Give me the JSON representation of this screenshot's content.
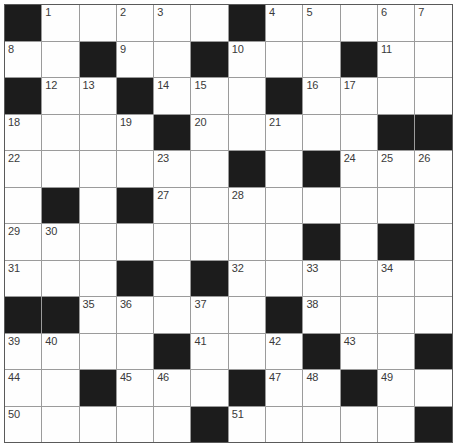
{
  "puzzle": {
    "kind": "crossword-grid",
    "rows": 12,
    "cols": 12,
    "black_marker": "B",
    "grid": [
      [
        "B",
        "1",
        "",
        "2",
        "3",
        "",
        "B",
        "4",
        "5",
        "",
        "6",
        "7"
      ],
      [
        "8",
        "",
        "B",
        "9",
        "",
        "B",
        "10",
        "",
        "",
        "B",
        "11",
        ""
      ],
      [
        "B",
        "12",
        "13",
        "B",
        "14",
        "15",
        "",
        "B",
        "16",
        "17",
        "",
        ""
      ],
      [
        "18",
        "",
        "",
        "19",
        "B",
        "20",
        "",
        "21",
        "",
        "",
        "B",
        "B"
      ],
      [
        "22",
        "",
        "",
        "",
        "23",
        "",
        "B",
        "",
        "B",
        "24",
        "25",
        "26"
      ],
      [
        "",
        "B",
        "",
        "B",
        "27",
        "",
        "28",
        "",
        "",
        "",
        "",
        ""
      ],
      [
        "29",
        "30",
        "",
        "",
        "",
        "",
        "",
        "",
        "B",
        "",
        "B",
        ""
      ],
      [
        "31",
        "",
        "",
        "B",
        "",
        "B",
        "32",
        "",
        "33",
        "",
        "34",
        ""
      ],
      [
        "B",
        "B",
        "35",
        "36",
        "",
        "37",
        "",
        "B",
        "38",
        "",
        "",
        ""
      ],
      [
        "39",
        "40",
        "",
        "",
        "B",
        "41",
        "",
        "42",
        "B",
        "43",
        "",
        "B"
      ],
      [
        "44",
        "",
        "B",
        "45",
        "46",
        "",
        "B",
        "47",
        "48",
        "B",
        "49",
        ""
      ],
      [
        "50",
        "",
        "",
        "",
        "",
        "B",
        "51",
        "",
        "",
        "",
        "",
        "B"
      ]
    ],
    "clue_numbers_visible": [
      "1",
      "2",
      "3",
      "4",
      "5",
      "6",
      "7",
      "8",
      "9",
      "10",
      "11",
      "12",
      "13",
      "14",
      "15",
      "16",
      "17",
      "18",
      "19",
      "20",
      "21",
      "22",
      "23",
      "24",
      "25",
      "26",
      "27",
      "28",
      "29",
      "30",
      "31",
      "32",
      "33",
      "34",
      "35",
      "36",
      "37",
      "38",
      "39",
      "40",
      "41",
      "42",
      "43",
      "44",
      "45",
      "46",
      "47",
      "48",
      "49",
      "50",
      "51"
    ],
    "colors": {
      "page_background": "#ffffff",
      "grid_line": "#9b9b9b",
      "outer_border": "#5a5a5a",
      "black_square": "#1c1c1c",
      "white_square": "#fefefe",
      "number_text": "#3a3a3a"
    }
  }
}
